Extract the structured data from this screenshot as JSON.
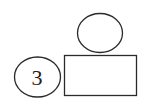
{
  "diagram": {
    "shapes": [
      {
        "type": "ellipse",
        "role": "top-ellipse",
        "label": ""
      },
      {
        "type": "rectangle",
        "role": "rectangle",
        "label": ""
      },
      {
        "type": "ellipse",
        "role": "left-ellipse",
        "label": "3"
      }
    ],
    "left_ellipse_label": "3",
    "stroke_color": "#2a2a2a",
    "background": "#ffffff"
  }
}
